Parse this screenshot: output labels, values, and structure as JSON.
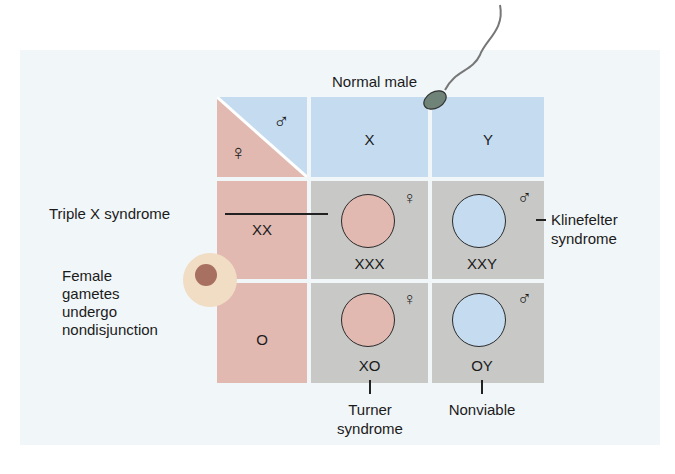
{
  "title_top": "Normal male",
  "corner": {
    "male_symbol": "♂",
    "female_symbol": "♀"
  },
  "columns": [
    "X",
    "Y"
  ],
  "rows": [
    "XX",
    "O"
  ],
  "cells": [
    {
      "genotype": "XXX",
      "sex_symbol": "♀",
      "color": "#e1b9b1"
    },
    {
      "genotype": "XXY",
      "sex_symbol": "♂",
      "color": "#c5dcf0"
    },
    {
      "genotype": "XO",
      "sex_symbol": "♀",
      "color": "#e1b9b1"
    },
    {
      "genotype": "OY",
      "sex_symbol": "♂",
      "color": "#c5dcf0"
    }
  ],
  "annotations": {
    "triple_x": "Triple X syndrome",
    "klinefelter_1": "Klinefelter",
    "klinefelter_2": "syndrome",
    "female_1": "Female",
    "female_2": "gametes",
    "female_3": "undergo",
    "female_4": "nondisjunction",
    "turner_1": "Turner",
    "turner_2": "syndrome",
    "nonviable": "Nonviable"
  },
  "colors": {
    "female": "#e1b9b1",
    "male": "#c5dcf0",
    "offspring_bg": "#c8c9c7"
  }
}
